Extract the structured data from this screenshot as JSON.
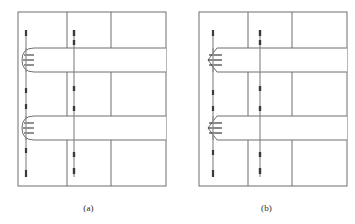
{
  "figure": {
    "type": "structural-detail-diagram",
    "background_color": "#ffffff",
    "line_color": "#5a5a5a",
    "bar_color": "#4a4a4a",
    "frame_color": "#6e6e6e",
    "panel_count": 2
  },
  "panels": [
    {
      "id": "a",
      "caption": "(a)",
      "anchorage_type": "hooked-bar-anchorage",
      "anchorage_shape": "rounded",
      "beam_count": 2,
      "column_line_count": 3,
      "vertical_bar_count": 2,
      "frame": {
        "x": 18,
        "y": 12,
        "width": 148,
        "height": 174
      },
      "column_lines_x": [
        67,
        111
      ],
      "vertical_bars_x": [
        26,
        74
      ],
      "beams": [
        {
          "label": "upper-beam",
          "y": 48,
          "height": 24,
          "x_start": 26,
          "x_end": 166
        },
        {
          "label": "lower-beam",
          "y": 116,
          "height": 24,
          "x_start": 26,
          "x_end": 166
        }
      ]
    },
    {
      "id": "b",
      "caption": "(b)",
      "anchorage_type": "bent-bar-anchorage",
      "anchorage_shape": "chamfered",
      "beam_count": 2,
      "column_line_count": 3,
      "vertical_bar_count": 2,
      "frame": {
        "x": 21,
        "y": 12,
        "width": 148,
        "height": 174
      },
      "column_lines_x": [
        70,
        114
      ],
      "vertical_bars_x": [
        35,
        82
      ],
      "beams": [
        {
          "label": "upper-beam",
          "y": 48,
          "height": 24,
          "x_start": 35,
          "x_end": 169
        },
        {
          "label": "lower-beam",
          "y": 116,
          "height": 24,
          "x_start": 35,
          "x_end": 169
        }
      ]
    }
  ]
}
